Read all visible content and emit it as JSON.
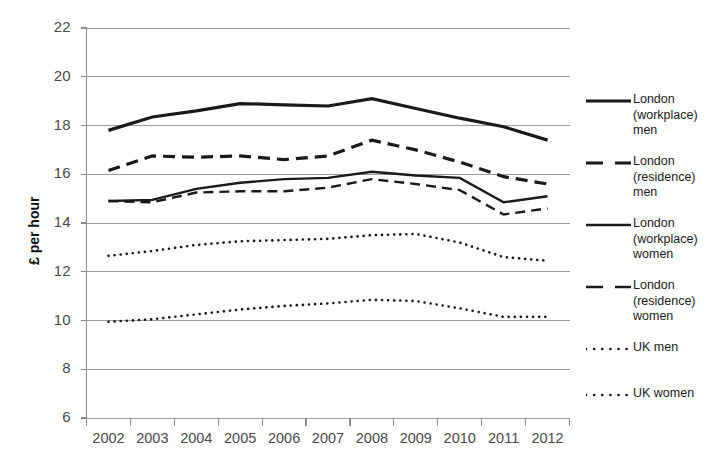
{
  "chart_data": {
    "type": "line",
    "title": "",
    "xlabel": "",
    "ylabel": "£ per hour",
    "x": [
      2002,
      2003,
      2004,
      2005,
      2006,
      2007,
      2008,
      2009,
      2010,
      2011,
      2012
    ],
    "categories": [
      "2002",
      "2003",
      "2004",
      "2005",
      "2006",
      "2007",
      "2008",
      "2009",
      "2010",
      "2011",
      "2012"
    ],
    "xlim": [
      2001.5,
      2012.5
    ],
    "ylim": [
      6,
      22
    ],
    "yticks": [
      6,
      8,
      10,
      12,
      14,
      16,
      18,
      20,
      22
    ],
    "ytick_labels": [
      "6",
      "8",
      "10",
      "12",
      "14",
      "16",
      "18",
      "20",
      "22"
    ],
    "grid": "horizontal",
    "legend_position": "right",
    "series": [
      {
        "name": "London (workplace) men",
        "legend_label": "London\n(workplace)\nmen",
        "style": "solid",
        "width": 3.2,
        "color": "#1a1a1a",
        "values": [
          17.8,
          18.35,
          18.6,
          18.9,
          18.85,
          18.8,
          19.1,
          18.7,
          18.3,
          17.95,
          17.4
        ]
      },
      {
        "name": "London (residence) men",
        "legend_label": "London\n(residence)\nmen",
        "style": "dashed",
        "width": 3.2,
        "color": "#1a1a1a",
        "values": [
          16.15,
          16.75,
          16.7,
          16.75,
          16.6,
          16.75,
          17.4,
          17.0,
          16.5,
          15.9,
          15.6
        ]
      },
      {
        "name": "London (workplace) women",
        "legend_label": "London\n(workplace)\nwomen",
        "style": "solid",
        "width": 2.4,
        "color": "#1a1a1a",
        "values": [
          14.9,
          14.95,
          15.4,
          15.65,
          15.8,
          15.85,
          16.1,
          15.95,
          15.85,
          14.85,
          15.1
        ]
      },
      {
        "name": "London (residence) women",
        "legend_label": "London\n(residence)\nwomen",
        "style": "dashed",
        "width": 2.4,
        "color": "#1a1a1a",
        "values": [
          14.9,
          14.85,
          15.25,
          15.3,
          15.3,
          15.45,
          15.8,
          15.6,
          15.35,
          14.35,
          14.6
        ]
      },
      {
        "name": "UK men",
        "legend_label": "UK men",
        "style": "dotted",
        "width": 2.6,
        "color": "#1a1a1a",
        "values": [
          12.65,
          12.85,
          13.1,
          13.25,
          13.3,
          13.35,
          13.5,
          13.55,
          13.2,
          12.6,
          12.45
        ]
      },
      {
        "name": "UK women",
        "legend_label": "UK women",
        "style": "dotted",
        "width": 2.6,
        "color": "#1a1a1a",
        "values": [
          9.95,
          10.05,
          10.25,
          10.45,
          10.6,
          10.7,
          10.85,
          10.8,
          10.5,
          10.15,
          10.15
        ]
      }
    ]
  },
  "axes": {
    "y_axis_title": "£ per hour"
  },
  "colors": {
    "line": "#1a1a1a",
    "grid": "#9a9a9a",
    "axis": "#8c8c8c",
    "tick_text": "#4a4a4a",
    "legend_text": "#1a1a1a",
    "background": "#ffffff"
  }
}
